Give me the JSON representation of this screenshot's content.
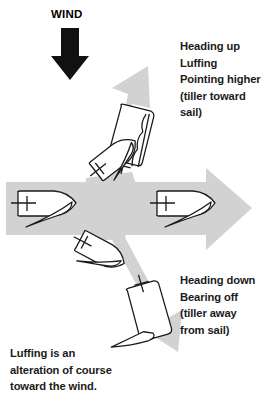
{
  "figure": {
    "wind_label": "WIND",
    "wind_arrow_icon": "wind-arrow-down-icon",
    "colors": {
      "arrow_gray": "#d2d2d2",
      "wind_black": "#111111",
      "boat_white": "#ffffff",
      "outline_black": "#1a1a1a",
      "text_black": "#1a1a1a",
      "background": "#ffffff"
    }
  },
  "annotations": {
    "heading_up": {
      "lines": [
        "Heading up",
        "Luffing",
        "Pointing higher",
        "(tiller toward",
        "sail)"
      ],
      "line_0": "Heading up",
      "line_1": "Luffing",
      "line_2": "Pointing higher",
      "line_3": "(tiller toward",
      "line_4": "sail)"
    },
    "heading_down": {
      "lines": [
        "Heading down",
        "Bearing off",
        "(tiller away",
        "from sail)"
      ],
      "line_0": "Heading down",
      "line_1": "Bearing off",
      "line_2": "(tiller away",
      "line_3": "from sail)"
    },
    "caption": {
      "lines": [
        "Luffing is an",
        "alteration of course",
        "toward the wind."
      ],
      "line_0": "Luffing is an",
      "line_1": "alteration of course",
      "line_2": "toward the wind."
    }
  },
  "boats": [
    {
      "id": "boat-left",
      "name": "boat-left-close-hauled",
      "description": "Sailboat heading right with sail trimmed, on left branch of arrow"
    },
    {
      "id": "boat-upper",
      "name": "boat-upper-luffing",
      "description": "Sailboat pointing up-right with luffing flapping sail"
    },
    {
      "id": "boat-middle-upper",
      "name": "boat-middle-heading-up",
      "description": "Sailboat turning up at the junction"
    },
    {
      "id": "boat-middle-lower",
      "name": "boat-middle-heading-down",
      "description": "Sailboat turning down at the junction"
    },
    {
      "id": "boat-lower",
      "name": "boat-lower-bearing-off",
      "description": "Sailboat pointing down-right bearing off"
    },
    {
      "id": "boat-right",
      "name": "boat-right-on-course",
      "description": "Sailboat heading right on the main arrow"
    }
  ]
}
